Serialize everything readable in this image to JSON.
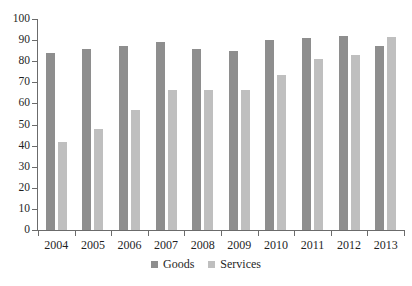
{
  "chart_data": {
    "type": "bar",
    "title": "",
    "subtitle": "",
    "xlabel": "",
    "ylabel": "",
    "categories": [
      "2004",
      "2005",
      "2006",
      "2007",
      "2008",
      "2009",
      "2010",
      "2011",
      "2012",
      "2013"
    ],
    "series": [
      {
        "name": "Goods",
        "color": "#8e8e8e",
        "values": [
          84,
          86,
          87,
          89,
          86,
          85,
          90,
          91,
          92,
          87
        ]
      },
      {
        "name": "Services",
        "color": "#bfbfbf",
        "values": [
          41.5,
          48,
          57,
          66.5,
          66.5,
          66.5,
          73.5,
          81,
          83,
          91.5
        ]
      }
    ],
    "ylim": [
      0,
      100
    ],
    "y_ticks": [
      0,
      10,
      20,
      30,
      40,
      50,
      60,
      70,
      80,
      90,
      100
    ],
    "y_tick_labels": [
      "0",
      "10",
      "20",
      "30",
      "40",
      "50",
      "60",
      "70",
      "80",
      "90",
      "100"
    ],
    "grid": false,
    "legend_position": "bottom"
  },
  "legend": {
    "items": [
      {
        "label": "Goods",
        "swatch": "goods-swatch"
      },
      {
        "label": "Services",
        "swatch": "services-swatch"
      }
    ]
  },
  "axes": {
    "y_axis_name": "y-axis",
    "x_axis_name": "x-axis"
  }
}
